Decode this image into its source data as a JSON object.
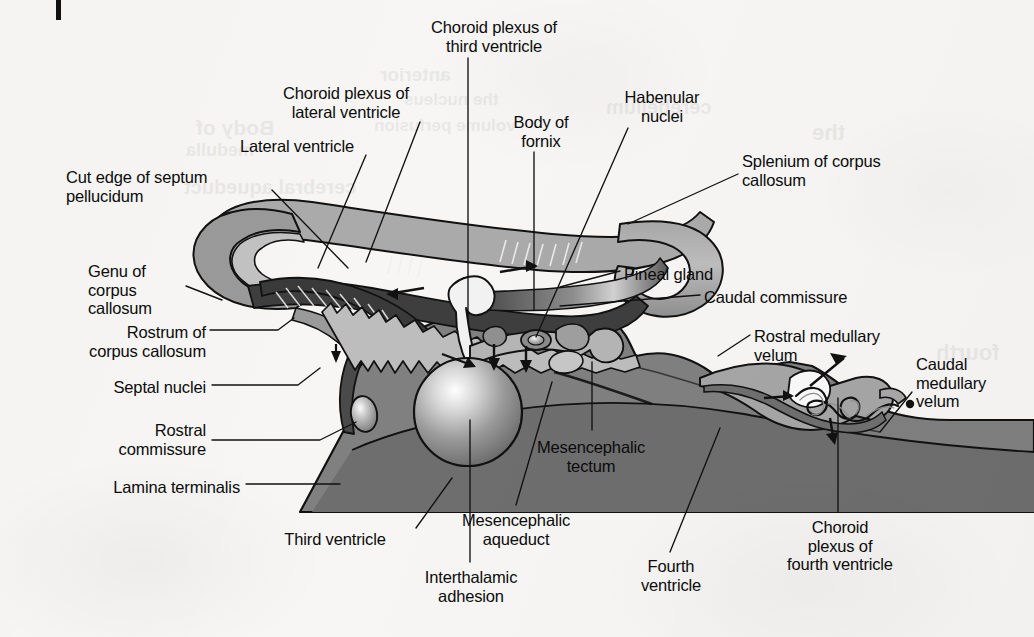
{
  "figure": {
    "type": "anatomical-diagram",
    "corner_mark": "page-edge-mark"
  },
  "colors": {
    "background": "#f7f6f4",
    "outline": "#111111",
    "cortex_light": "#b9b9b9",
    "cortex_mid": "#9a9a9a",
    "ependyma_dark": "#4a4a4a",
    "brainstem": "#808080",
    "brainstem_dark": "#6e6e6e",
    "plexus_light": "#c9c9c9",
    "ventricle_white": "#f7f6f4",
    "sphere_highlight": "#ffffff"
  },
  "labels": [
    {
      "id": "choroid-plexus-third-ventricle",
      "text": "Choroid plexus of\nthird ventricle",
      "align": "center",
      "x": 396,
      "y": 18,
      "width": 196
    },
    {
      "id": "choroid-plexus-lateral-ventricle",
      "text": "Choroid plexus of\nlateral ventricle",
      "align": "center",
      "x": 250,
      "y": 84,
      "width": 192
    },
    {
      "id": "habenular-nuclei",
      "text": "Habenular\nnuclei",
      "align": "center",
      "x": 604,
      "y": 88,
      "width": 116
    },
    {
      "id": "body-of-fornix",
      "text": "Body of\nfornix",
      "align": "center",
      "x": 495,
      "y": 113,
      "width": 92
    },
    {
      "id": "lateral-ventricle",
      "text": "Lateral ventricle",
      "align": "center",
      "x": 212,
      "y": 137,
      "width": 170
    },
    {
      "id": "splenium-of-corpus-callosum",
      "text": "Splenium of corpus\ncallosum",
      "align": "left",
      "x": 742,
      "y": 152,
      "width": 220
    },
    {
      "id": "cut-edge-of-septum-pellucidum",
      "text": "Cut edge of septum\npellucidum",
      "align": "left",
      "x": 66,
      "y": 168,
      "width": 212
    },
    {
      "id": "genu-of-corpus-callosum",
      "text": "Genu of\ncorpus\ncallosum",
      "align": "left",
      "x": 88,
      "y": 262,
      "width": 92
    },
    {
      "id": "pineal-gland",
      "text": "Pineal gland",
      "align": "left",
      "x": 624,
      "y": 265,
      "width": 130
    },
    {
      "id": "caudal-commissure",
      "text": "Caudal commissure",
      "align": "left",
      "x": 704,
      "y": 288,
      "width": 210
    },
    {
      "id": "rostrum-of-corpus-callosum",
      "text": "Rostrum of\ncorpus callosum",
      "align": "right",
      "x": 36,
      "y": 323,
      "width": 170
    },
    {
      "id": "rostral-medullary-velum",
      "text": "Rostral medullary\nvelum",
      "align": "left",
      "x": 754,
      "y": 327,
      "width": 190
    },
    {
      "id": "caudal-medullary-velum",
      "text": "Caudal\nmedullary\nvelum",
      "align": "left",
      "x": 916,
      "y": 355,
      "width": 112
    },
    {
      "id": "septal-nuclei",
      "text": "Septal nuclei",
      "align": "right",
      "x": 88,
      "y": 378,
      "width": 118
    },
    {
      "id": "rostral-commissure",
      "text": "Rostral\ncommissure",
      "align": "right",
      "x": 82,
      "y": 421,
      "width": 124
    },
    {
      "id": "mesencephalic-tectum",
      "text": "Mesencephalic\ntectum",
      "align": "center",
      "x": 512,
      "y": 438,
      "width": 158
    },
    {
      "id": "lamina-terminalis",
      "text": "Lamina terminalis",
      "align": "right",
      "x": 60,
      "y": 478,
      "width": 180
    },
    {
      "id": "mesencephalic-aqueduct",
      "text": "Mesencephalic\naqueduct",
      "align": "center",
      "x": 434,
      "y": 511,
      "width": 164
    },
    {
      "id": "choroid-plexus-fourth-ventricle",
      "text": "Choroid\nplexus of\nfourth ventricle",
      "align": "center",
      "x": 760,
      "y": 518,
      "width": 160
    },
    {
      "id": "third-ventricle",
      "text": "Third ventricle",
      "align": "center",
      "x": 256,
      "y": 530,
      "width": 158
    },
    {
      "id": "fourth-ventricle",
      "text": "Fourth\nventricle",
      "align": "center",
      "x": 624,
      "y": 557,
      "width": 94
    },
    {
      "id": "interthalamic-adhesion",
      "text": "Interthalamic\nadhesion",
      "align": "center",
      "x": 400,
      "y": 568,
      "width": 142
    }
  ],
  "leader_lines": [
    {
      "id": "leader-choroid-plexus-third-ventricle",
      "points": "468,58 468,318"
    },
    {
      "id": "leader-choroid-plexus-lateral-ventricle",
      "points": "420,122 366,262"
    },
    {
      "id": "leader-habenular-nuclei",
      "points": "628,128 536,337"
    },
    {
      "id": "leader-body-of-fornix",
      "points": "534,152 534,310"
    },
    {
      "id": "leader-lateral-ventricle",
      "points": "366,155 318,268"
    },
    {
      "id": "leader-splenium-of-corpus-callosum",
      "points": "738,174 628,224"
    },
    {
      "id": "leader-cut-edge-of-septum-pellucidum",
      "points": "272,190 348,268"
    },
    {
      "id": "leader-genu-of-corpus-callosum",
      "points": "186,286 222,300"
    },
    {
      "id": "leader-pineal-gland",
      "points": "620,271 560,287"
    },
    {
      "id": "leader-caudal-commissure",
      "points": "700,295 560,306"
    },
    {
      "id": "leader-rostrum-of-corpus-callosum",
      "points": "210,330 278,330 294,318"
    },
    {
      "id": "leader-rostral-medullary-velum",
      "points": "750,335 718,356"
    },
    {
      "id": "leader-caudal-medullary-velum",
      "points": "912,392 880,432"
    },
    {
      "id": "leader-septal-nuclei",
      "points": "212,385 298,385 320,368"
    },
    {
      "id": "leader-rostral-commissure",
      "points": "212,440 320,440 356,422"
    },
    {
      "id": "leader-mesencephalic-tectum",
      "points": "592,430 592,362"
    },
    {
      "id": "leader-lamina-terminalis",
      "points": "246,484 340,484"
    },
    {
      "id": "leader-mesencephalic-aqueduct",
      "points": "516,505 552,382"
    },
    {
      "id": "leader-choroid-plexus-fourth-ventricle",
      "points": "838,512 838,398"
    },
    {
      "id": "leader-third-ventricle",
      "points": "416,528 452,478"
    },
    {
      "id": "leader-fourth-ventricle",
      "points": "670,552 720,428"
    },
    {
      "id": "leader-interthalamic-adhesion",
      "points": "470,562 470,420"
    }
  ],
  "bleed_through": [
    {
      "text": "Body of",
      "x": 196,
      "y": 116,
      "size": 21
    },
    {
      "text": "medulla",
      "x": 186,
      "y": 140,
      "size": 18
    },
    {
      "text": "cerebral aqueduct",
      "x": 184,
      "y": 176,
      "size": 20
    },
    {
      "text": "the midbrain",
      "x": 466,
      "y": 236,
      "size": 22
    },
    {
      "text": "cerebellum",
      "x": 606,
      "y": 96,
      "size": 20
    },
    {
      "text": "anterior",
      "x": 380,
      "y": 64,
      "size": 19
    },
    {
      "text": "the nucleus",
      "x": 404,
      "y": 90,
      "size": 17
    },
    {
      "text": "volume perfusion",
      "x": 374,
      "y": 116,
      "size": 17
    },
    {
      "text": "fourth",
      "x": 936,
      "y": 340,
      "size": 22
    },
    {
      "text": "the",
      "x": 812,
      "y": 120,
      "size": 22
    },
    {
      "text": "pons",
      "x": 880,
      "y": 436,
      "size": 20
    }
  ]
}
